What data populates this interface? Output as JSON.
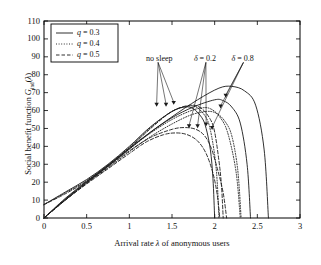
{
  "chart_data": {
    "type": "line",
    "title": "",
    "xlabel": "Arrival rate λ of anonymous users",
    "ylabel": "Social benefit function G_ind(λ)",
    "xlim": [
      0,
      3
    ],
    "ylim": [
      0,
      110
    ],
    "xticks": [
      "0",
      "0.5",
      "1",
      "1.5",
      "2",
      "2.5",
      "3"
    ],
    "xtick_values": [
      0,
      0.5,
      1,
      1.5,
      2,
      2.5,
      3
    ],
    "yticks": [
      "0",
      "10",
      "20",
      "30",
      "40",
      "50",
      "60",
      "70",
      "80",
      "90",
      "100",
      "110"
    ],
    "ytick_values": [
      0,
      10,
      20,
      30,
      40,
      50,
      60,
      70,
      80,
      90,
      100,
      110
    ],
    "grid": false,
    "legend_position": "top-left",
    "legend": [
      {
        "label": "q = 0.3",
        "style": "solid"
      },
      {
        "label": "q = 0.4",
        "style": "dotted"
      },
      {
        "label": "q = 0.5",
        "style": "dashed"
      }
    ],
    "annotations": [
      {
        "text": "no sleep",
        "x": 1.22,
        "y": 88,
        "points_to": [
          [
            1.32,
            62
          ],
          [
            1.43,
            62
          ],
          [
            1.52,
            63
          ]
        ]
      },
      {
        "text": "δ = 0.2",
        "x": 1.78,
        "y": 88,
        "points_to": [
          [
            1.7,
            50
          ],
          [
            1.8,
            50
          ],
          [
            1.9,
            51
          ]
        ]
      },
      {
        "text": "δ = 0.8",
        "x": 2.22,
        "y": 88,
        "points_to": [
          [
            1.97,
            49
          ],
          [
            2.07,
            61
          ],
          [
            2.13,
            67
          ]
        ]
      }
    ],
    "series": [
      {
        "name": "no sleep, q = 0.3",
        "group": "no sleep",
        "q": 0.3,
        "style": "solid",
        "x": [
          0,
          0.25,
          0.5,
          0.75,
          1.0,
          1.25,
          1.5,
          1.65,
          1.75,
          1.85,
          1.9,
          1.95,
          1.98,
          2.0
        ],
        "y": [
          7.5,
          14.5,
          21.5,
          30.0,
          40.0,
          51.0,
          59.5,
          62.0,
          61.0,
          56.0,
          50.0,
          38.0,
          22.0,
          0
        ]
      },
      {
        "name": "no sleep, q = 0.4",
        "group": "no sleep",
        "q": 0.4,
        "style": "dotted",
        "x": [
          0,
          0.25,
          0.5,
          0.75,
          1.0,
          1.25,
          1.5,
          1.7,
          1.8,
          1.9,
          1.95,
          2.0,
          2.03,
          2.05
        ],
        "y": [
          7.5,
          14.0,
          21.0,
          29.5,
          39.5,
          50.5,
          59.5,
          62.5,
          61.5,
          56.0,
          49.0,
          35.0,
          20.0,
          0
        ]
      },
      {
        "name": "no sleep, q = 0.5",
        "group": "no sleep",
        "q": 0.5,
        "style": "dashed",
        "x": [
          0,
          0.25,
          0.5,
          0.75,
          1.0,
          1.25,
          1.5,
          1.72,
          1.85,
          1.95,
          2.0,
          2.05,
          2.08,
          2.1
        ],
        "y": [
          7.5,
          13.5,
          20.5,
          29.0,
          39.0,
          50.0,
          59.5,
          63.0,
          61.0,
          55.0,
          48.0,
          32.0,
          18.0,
          0
        ]
      },
      {
        "name": "δ = 0.2, q = 0.3",
        "group": "δ = 0.2",
        "delta": 0.2,
        "q": 0.3,
        "style": "solid",
        "x": [
          0,
          0.25,
          0.5,
          0.75,
          1.0,
          1.25,
          1.5,
          1.75,
          2.0,
          2.1,
          2.2,
          2.3,
          2.38,
          2.42
        ],
        "y": [
          0,
          11.0,
          20.5,
          29.5,
          39.0,
          48.0,
          56.0,
          62.0,
          66.0,
          65.5,
          62.0,
          53.0,
          30.0,
          0
        ]
      },
      {
        "name": "δ = 0.2, q = 0.4",
        "group": "δ = 0.2",
        "delta": 0.2,
        "q": 0.4,
        "style": "dotted",
        "x": [
          0,
          0.25,
          0.5,
          0.75,
          1.0,
          1.25,
          1.5,
          1.7,
          1.85,
          1.95,
          2.05,
          2.15,
          2.25,
          2.3
        ],
        "y": [
          0,
          10.5,
          20.0,
          29.0,
          38.5,
          47.5,
          55.0,
          59.5,
          61.5,
          61.0,
          57.0,
          48.0,
          26.0,
          0
        ]
      },
      {
        "name": "δ = 0.2, q = 0.5",
        "group": "δ = 0.2",
        "delta": 0.2,
        "q": 0.5,
        "style": "dashed",
        "x": [
          0,
          0.25,
          0.5,
          0.75,
          1.0,
          1.25,
          1.5,
          1.65,
          1.78,
          1.88,
          1.96,
          2.04,
          2.1,
          2.14
        ],
        "y": [
          0,
          10.0,
          19.5,
          28.5,
          37.5,
          45.0,
          49.5,
          50.5,
          49.5,
          46.0,
          39.0,
          26.0,
          14.0,
          0
        ]
      },
      {
        "name": "δ = 0.8, q = 0.3",
        "group": "δ = 0.8",
        "delta": 0.8,
        "q": 0.3,
        "style": "solid",
        "x": [
          0,
          0.25,
          0.5,
          0.75,
          1.0,
          1.25,
          1.5,
          1.8,
          2.05,
          2.2,
          2.35,
          2.48,
          2.58,
          2.63
        ],
        "y": [
          0,
          10.5,
          20.0,
          29.0,
          38.5,
          48.0,
          56.5,
          66.0,
          72.5,
          73.5,
          71.0,
          63.0,
          38.0,
          0
        ]
      },
      {
        "name": "δ = 0.8, q = 0.4",
        "group": "δ = 0.8",
        "delta": 0.8,
        "q": 0.4,
        "style": "dotted",
        "x": [
          0,
          0.25,
          0.5,
          0.75,
          1.0,
          1.25,
          1.5,
          1.72,
          1.9,
          2.02,
          2.12,
          2.2,
          2.27,
          2.31
        ],
        "y": [
          0,
          10.0,
          19.5,
          28.0,
          37.0,
          45.5,
          52.5,
          57.5,
          59.5,
          58.5,
          54.0,
          46.0,
          27.0,
          0
        ]
      },
      {
        "name": "δ = 0.8, q = 0.5",
        "group": "δ = 0.8",
        "delta": 0.8,
        "q": 0.5,
        "style": "dashed",
        "x": [
          0,
          0.25,
          0.5,
          0.75,
          1.0,
          1.2,
          1.4,
          1.55,
          1.68,
          1.8,
          1.9,
          1.98,
          2.03,
          2.06
        ],
        "y": [
          0,
          10.0,
          19.0,
          27.5,
          36.0,
          42.5,
          46.5,
          47.5,
          46.5,
          43.0,
          36.0,
          25.0,
          13.0,
          0
        ]
      }
    ]
  },
  "axes": {
    "frame_color": "#000000",
    "line_color": "#1a1a1a"
  }
}
